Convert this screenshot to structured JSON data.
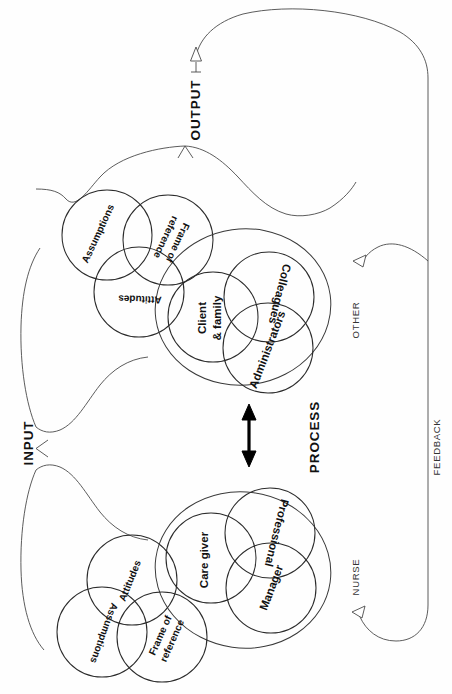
{
  "figure": {
    "title": "",
    "orientation": "rotated-90-degrees",
    "stage_labels": [
      {
        "id": "output",
        "text": "OUTPUT"
      },
      {
        "id": "input",
        "text": "INPUT"
      },
      {
        "id": "process",
        "text": "PROCESS"
      }
    ],
    "side_labels": [
      {
        "id": "other",
        "text": "OTHER"
      },
      {
        "id": "nurse",
        "text": "NURSE"
      },
      {
        "id": "feedback",
        "text": "FEEDBACK"
      }
    ],
    "groups": [
      {
        "id": "other-perception-set",
        "belongs_to": "OTHER",
        "kind": "venn-3",
        "circles": [
          {
            "id": "other-assumptions",
            "label": "Assumptions"
          },
          {
            "id": "other-frame-of-reference",
            "label": "Frame of\nreference",
            "label_line1": "Frame of",
            "label_line2": "reference"
          },
          {
            "id": "other-attitudes",
            "label": "Attitudes"
          }
        ]
      },
      {
        "id": "other-role-set",
        "belongs_to": "OTHER",
        "kind": "venn-3-in-oval",
        "circles": [
          {
            "id": "client-and-family",
            "label": "Client\n& family",
            "label_line1": "Client",
            "label_line2": "& family"
          },
          {
            "id": "colleagues",
            "label": "Colleagues"
          },
          {
            "id": "administrators",
            "label": "Administrators"
          }
        ]
      },
      {
        "id": "nurse-role-set",
        "belongs_to": "NURSE",
        "kind": "venn-3-in-oval",
        "circles": [
          {
            "id": "care-giver",
            "label": "Care giver"
          },
          {
            "id": "professional",
            "label": "Professional"
          },
          {
            "id": "manager",
            "label": "Manager"
          }
        ]
      },
      {
        "id": "nurse-perception-set",
        "belongs_to": "NURSE",
        "kind": "venn-3",
        "circles": [
          {
            "id": "nurse-attitudes",
            "label": "Attitudes"
          },
          {
            "id": "nurse-assumptions",
            "label": "Assumptions"
          },
          {
            "id": "nurse-frame-of-reference",
            "label": "Frame of\nreference",
            "label_line1": "Frame of",
            "label_line2": "reference"
          }
        ]
      }
    ],
    "connectors": [
      {
        "id": "output-arrow",
        "kind": "hollow-arrow",
        "direction": "up",
        "label": "OUTPUT"
      },
      {
        "id": "process-arrow",
        "kind": "double-headed-arrow",
        "direction": "vertical",
        "label": "PROCESS"
      },
      {
        "id": "feedback-loop",
        "kind": "curved-arrow-pair",
        "label": "FEEDBACK"
      },
      {
        "id": "output-brace",
        "kind": "brace"
      },
      {
        "id": "input-brace",
        "kind": "brace",
        "label": "INPUT"
      }
    ],
    "colors": {
      "line": "#4a4a4a",
      "circle_outline": "#2b2b2b",
      "text": "#111111",
      "background": "#ffffff"
    }
  }
}
